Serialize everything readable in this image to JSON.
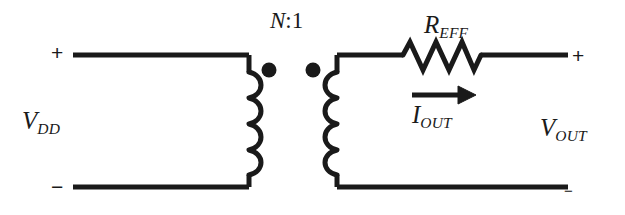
{
  "diagram": {
    "type": "circuit-schematic",
    "width": 625,
    "height": 215,
    "background_color": "#ffffff",
    "line_color": "#1a1a1a"
  },
  "labels": {
    "input_voltage": "V",
    "input_voltage_sub": "DD",
    "output_voltage": "V",
    "output_voltage_sub": "OUT",
    "turns_ratio_symbol": "N",
    "turns_ratio_rest": ":1",
    "resistor": "R",
    "resistor_sub": "EFF",
    "current": "I",
    "current_sub": "OUT",
    "plus_input": "+",
    "minus_input": "−",
    "plus_output": "+",
    "minus_output": "−"
  },
  "components": {
    "transformer": {
      "name": "transformer",
      "turns_ratio": "N:1",
      "primary_windings": 4,
      "secondary_windings": 4,
      "polarity_dots": 2,
      "dot_positions": [
        {
          "x": 269,
          "y": 70
        },
        {
          "x": 313,
          "y": 70
        }
      ]
    },
    "resistor": {
      "name": "R_EFF",
      "zigzag_peaks": 3,
      "start_x": 403,
      "end_x": 481,
      "center_y": 58
    },
    "current_arrow": {
      "name": "I_OUT",
      "direction": "right",
      "start_x": 412,
      "end_x": 472,
      "y": 95
    }
  },
  "nodes": {
    "primary_top_wire": {
      "x1": 73,
      "y1": 55,
      "x2": 249,
      "y2": 55
    },
    "primary_bottom_wire": {
      "x1": 73,
      "y1": 187,
      "x2": 249,
      "y2": 187
    },
    "secondary_top_wire": {
      "x1": 337,
      "y1": 55,
      "x2": 568,
      "y2": 55
    },
    "secondary_bottom_wire": {
      "x1": 337,
      "y1": 187,
      "x2": 568,
      "y2": 187
    }
  }
}
